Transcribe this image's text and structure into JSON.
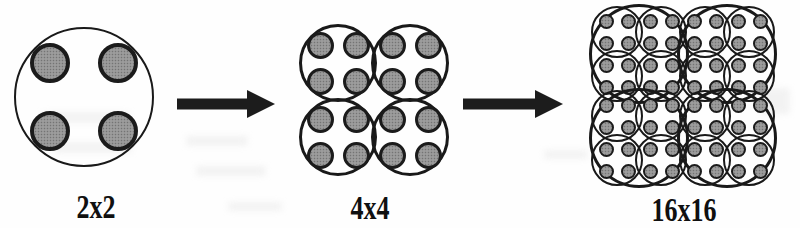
{
  "diagram": {
    "kind": "recursive-circle-packing",
    "colors": {
      "background": "#fefefe",
      "outline": "#191919",
      "dot_fill": "#949494",
      "arrow": "#1c1c1c",
      "label_text": "#101010"
    },
    "arrows": [
      {
        "icon": "right-arrow-icon",
        "direction": "right"
      },
      {
        "icon": "right-arrow-icon",
        "direction": "right"
      }
    ]
  },
  "figures": [
    {
      "label": "2x2",
      "description": "one outlined circle containing 4 shaded dots in a 2x2 grid",
      "counts": {
        "outer_circles": 1,
        "shaded_dots": 4
      },
      "center": {
        "x": 84,
        "y": 97
      },
      "node": {
        "kind": "circle",
        "r": 70,
        "stroke": 2.5,
        "off": 34,
        "child": {
          "kind": "dot",
          "r": 20,
          "ring": 4
        }
      }
    },
    {
      "label": "4x4",
      "description": "2x2 grid of overlapping outlined circles, each containing 4 shaded dots",
      "counts": {
        "outer_circles": 4,
        "shaded_dots": 16
      },
      "center": {
        "x": 374,
        "y": 100
      },
      "node": {
        "kind": "quad",
        "off": 36,
        "offY": 37,
        "child": {
          "kind": "circle",
          "r": 39,
          "stroke": 3,
          "off": 18,
          "child": {
            "kind": "dot",
            "r": 13.5,
            "ring": 3.5
          }
        }
      }
    },
    {
      "label": "16x16",
      "description": "2x2 grid of overlapping large circles, each containing a 2x2 grid of overlapping circles with 4 shaded dots each",
      "counts": {
        "outer_circles": 4,
        "inner_circles": 16,
        "shaded_dots": 64
      },
      "center": {
        "x": 683,
        "y": 96
      },
      "node": {
        "kind": "quad",
        "off": 44,
        "offY": 42,
        "child": {
          "kind": "circle",
          "r": 50,
          "stroke": 3.5,
          "off": 22,
          "child": {
            "kind": "circle",
            "r": 26,
            "stroke": 2.5,
            "off": 11,
            "child": {
              "kind": "dot",
              "r": 7.5,
              "ring": 2.5
            }
          }
        }
      }
    }
  ]
}
